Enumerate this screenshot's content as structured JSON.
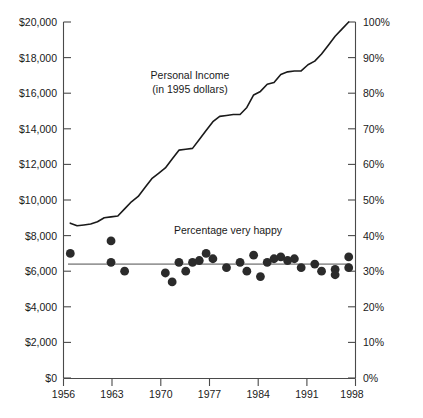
{
  "chart_data": {
    "type": "line",
    "title": "",
    "xlabel": "",
    "ylabel": "",
    "grid": false,
    "legend_position": "inline-annotations",
    "x_axis": {
      "ticks": [
        1956,
        1963,
        1970,
        1977,
        1984,
        1991,
        1998
      ],
      "tick_labels": [
        "1956",
        "1963",
        "1970",
        "1977",
        "1984",
        "1991",
        "1998"
      ],
      "xlim": [
        1956,
        1999
      ]
    },
    "y_axis_left": {
      "label": "Personal Income (in 1995 dollars)",
      "tick_labels": [
        "$0",
        "$2,000",
        "$4,000",
        "$6,000",
        "$8,000",
        "$10,000",
        "$12,000",
        "$14,000",
        "$16,000",
        "$18,000",
        "$20,000"
      ],
      "tick_values": [
        0,
        2000,
        4000,
        6000,
        8000,
        10000,
        12000,
        14000,
        16000,
        18000,
        20000
      ],
      "ylim": [
        0,
        20000
      ]
    },
    "y_axis_right": {
      "label": "Percentage very happy",
      "tick_labels": [
        "0%",
        "10%",
        "20%",
        "30%",
        "40%",
        "50%",
        "60%",
        "70%",
        "80%",
        "90%",
        "100%"
      ],
      "tick_values": [
        0,
        10,
        20,
        30,
        40,
        50,
        60,
        70,
        80,
        90,
        100
      ],
      "ylim": [
        0,
        100
      ]
    },
    "annotations": [
      {
        "id": "income-label",
        "line1": "Personal Income",
        "line2": "(in 1995 dollars)"
      },
      {
        "id": "happy-label",
        "line1": "Percentage very happy"
      }
    ],
    "series": [
      {
        "name": "Personal Income",
        "type": "line",
        "axis": "left",
        "units": "1995 dollars",
        "x": [
          1957,
          1958,
          1959,
          1960,
          1961,
          1962,
          1963,
          1964,
          1965,
          1966,
          1967,
          1968,
          1969,
          1970,
          1971,
          1972,
          1973,
          1974,
          1975,
          1976,
          1977,
          1978,
          1979,
          1980,
          1981,
          1982,
          1983,
          1984,
          1985,
          1986,
          1987,
          1988,
          1989,
          1990,
          1991,
          1992,
          1993,
          1994,
          1995,
          1996,
          1997,
          1998
        ],
        "values": [
          8700,
          8550,
          8600,
          8650,
          8780,
          9000,
          9050,
          9100,
          9500,
          9900,
          10200,
          10700,
          11200,
          11500,
          11800,
          12300,
          12800,
          12850,
          12900,
          13400,
          13900,
          14400,
          14700,
          14750,
          14800,
          14800,
          15200,
          15900,
          16100,
          16500,
          16600,
          17050,
          17200,
          17250,
          17250,
          17600,
          17800,
          18200,
          18700,
          19200,
          19600,
          20000
        ]
      },
      {
        "name": "Percentage very happy",
        "type": "scatter",
        "axis": "right",
        "units": "percent",
        "points": [
          {
            "x": 1957,
            "y": 35.0
          },
          {
            "x": 1963,
            "y": 38.5
          },
          {
            "x": 1963,
            "y": 32.5
          },
          {
            "x": 1965,
            "y": 30.0
          },
          {
            "x": 1971,
            "y": 29.5
          },
          {
            "x": 1972,
            "y": 27.0
          },
          {
            "x": 1973,
            "y": 32.5
          },
          {
            "x": 1974,
            "y": 30.0
          },
          {
            "x": 1975,
            "y": 32.5
          },
          {
            "x": 1976,
            "y": 33.0
          },
          {
            "x": 1977,
            "y": 35.0
          },
          {
            "x": 1978,
            "y": 33.5
          },
          {
            "x": 1980,
            "y": 31.0
          },
          {
            "x": 1982,
            "y": 32.5
          },
          {
            "x": 1983,
            "y": 30.0
          },
          {
            "x": 1984,
            "y": 34.5
          },
          {
            "x": 1985,
            "y": 28.5
          },
          {
            "x": 1986,
            "y": 32.5
          },
          {
            "x": 1987,
            "y": 33.5
          },
          {
            "x": 1988,
            "y": 34.0
          },
          {
            "x": 1989,
            "y": 33.0
          },
          {
            "x": 1990,
            "y": 33.5
          },
          {
            "x": 1991,
            "y": 31.0
          },
          {
            "x": 1993,
            "y": 32.0
          },
          {
            "x": 1994,
            "y": 30.0
          },
          {
            "x": 1996,
            "y": 30.5
          },
          {
            "x": 1996,
            "y": 29.0
          },
          {
            "x": 1998,
            "y": 34.0
          },
          {
            "x": 1998,
            "y": 31.0
          }
        ],
        "trend": {
          "type": "flat",
          "value": 32.0
        }
      }
    ]
  }
}
